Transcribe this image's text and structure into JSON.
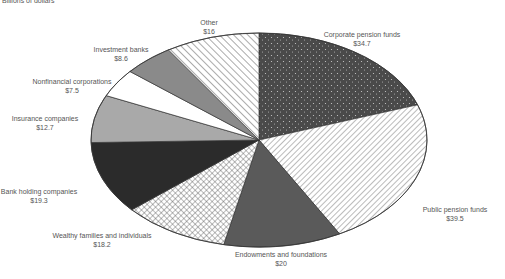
{
  "header": {
    "subtitle": "Billions of dollars"
  },
  "chart_data": {
    "type": "pie",
    "title": "",
    "subtitle": "Billions of dollars",
    "unit": "$ billions",
    "start_angle": "12 o'clock",
    "direction": "clockwise",
    "categories": [
      "Corporate pension funds",
      "Public pension funds",
      "Endowments and foundations",
      "Wealthy families and individuals",
      "Bank holding companies",
      "Insurance companies",
      "Nonfinancial corporations",
      "Investment banks",
      "Other"
    ],
    "values": [
      34.7,
      39.5,
      20,
      18.2,
      19.3,
      12.7,
      7.5,
      8.6,
      16
    ],
    "value_labels": [
      "$34.7",
      "$39.5",
      "$20",
      "$18.2",
      "$19.3",
      "$12.7",
      "$7.5",
      "$8.6",
      "$16"
    ],
    "fills": [
      "dots-dark",
      "diag-lines",
      "solid-darkgray",
      "crosshatch",
      "solid-black",
      "solid-lightgray",
      "solid-white",
      "solid-midgray",
      "diag-lines-sparse"
    ],
    "legend": "none (direct labels)"
  },
  "geometry": {
    "cx": 259,
    "cy": 140,
    "rx": 168,
    "ry": 107
  },
  "labels": [
    {
      "x": 362,
      "y": 30
    },
    {
      "x": 455,
      "y": 205
    },
    {
      "x": 281,
      "y": 250
    },
    {
      "x": 102,
      "y": 231
    },
    {
      "x": 39,
      "y": 187
    },
    {
      "x": 45,
      "y": 114
    },
    {
      "x": 72,
      "y": 77
    },
    {
      "x": 121,
      "y": 45
    },
    {
      "x": 209,
      "y": 18
    }
  ]
}
